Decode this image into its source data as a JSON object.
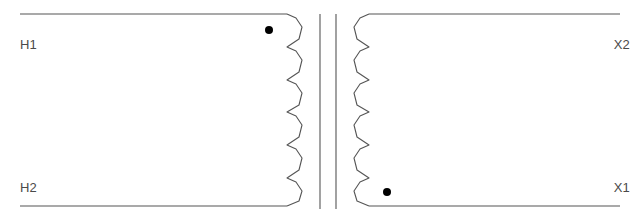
{
  "diagram": {
    "type": "single-phase transformer schematic",
    "primary": {
      "label_top": "H1",
      "label_bottom": "H2",
      "polarity_dot": "top",
      "coil_loops": 5
    },
    "secondary": {
      "label_top": "X2",
      "label_bottom": "X1",
      "polarity_dot": "bottom",
      "coil_loops": 5
    },
    "core": {
      "lines": 2
    },
    "colors": {
      "line": "#555555",
      "dot": "#000000",
      "label": "#4a4a4a",
      "background": "#ffffff"
    }
  }
}
